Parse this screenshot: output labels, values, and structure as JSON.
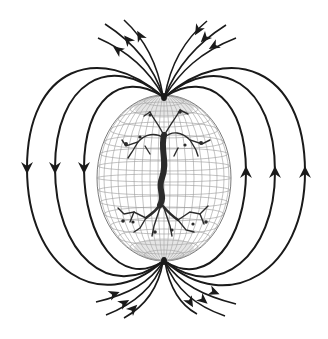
{
  "diagram": {
    "title": "Magnetic field lines around a globe with a tree of life",
    "colors": {
      "background": "#ffffff",
      "field_line": "#1a1a1a",
      "globe_grid": "#8a8a8a",
      "tree": "#2b2b2b"
    },
    "globe": {
      "cx": 164,
      "cy": 178,
      "rx": 67,
      "ry": 83
    },
    "poles": {
      "north": [
        164,
        95
      ],
      "south": [
        164,
        262
      ]
    },
    "closed_loops_left": [
      {
        "x": 84,
        "arrow_y": 168,
        "arrow_dir": "down"
      },
      {
        "x": 55,
        "arrow_y": 168,
        "arrow_dir": "down"
      },
      {
        "x": 27,
        "arrow_y": 168,
        "arrow_dir": "down"
      }
    ],
    "closed_loops_right": [
      {
        "x": 246,
        "arrow_y": 172,
        "arrow_dir": "up"
      },
      {
        "x": 275,
        "arrow_y": 172,
        "arrow_dir": "up"
      },
      {
        "x": 305,
        "arrow_y": 172,
        "arrow_dir": "up"
      }
    ],
    "open_lines_top_left_count": 3,
    "open_lines_top_right_count": 3,
    "open_lines_bottom_left_count": 3,
    "open_lines_bottom_right_count": 3,
    "elements": [
      "globe-wireframe",
      "tree-trunk",
      "tree-branches",
      "tree-roots",
      "field-lines",
      "arrowheads"
    ]
  }
}
